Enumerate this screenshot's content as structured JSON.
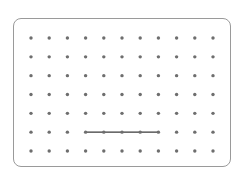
{
  "diagram": {
    "type": "dot-grid",
    "columns": 11,
    "rows": 7,
    "dot_color": "#6e6e6e",
    "line_color": "#3a3a3a",
    "border_color": "#9a9a9a",
    "segments": [
      {
        "row": 6,
        "from_col": 4,
        "to_col": 8
      }
    ]
  }
}
